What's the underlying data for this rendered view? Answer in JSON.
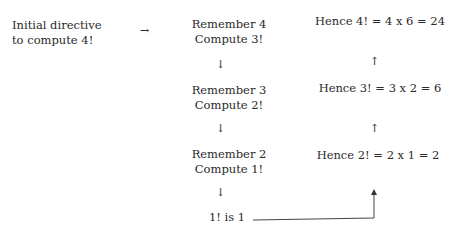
{
  "diagram": {
    "initial": {
      "line1": "Initial directive",
      "line2": "to compute 4!"
    },
    "right_arrow": "→",
    "left_column": [
      {
        "line1": "Remember 4",
        "line2": "Compute 3!"
      },
      {
        "line1": "Remember 3",
        "line2": "Compute 2!"
      },
      {
        "line1": "Remember 2",
        "line2": "Compute 1!"
      }
    ],
    "base_case": "1! is 1",
    "right_column": [
      "Hence 4! = 4 x 6 = 24",
      "Hence 3! = 3 x 2 = 6",
      "Hence 2! = 2 x 1 = 2"
    ],
    "down_arrow": "↓",
    "up_arrow": "↑"
  }
}
